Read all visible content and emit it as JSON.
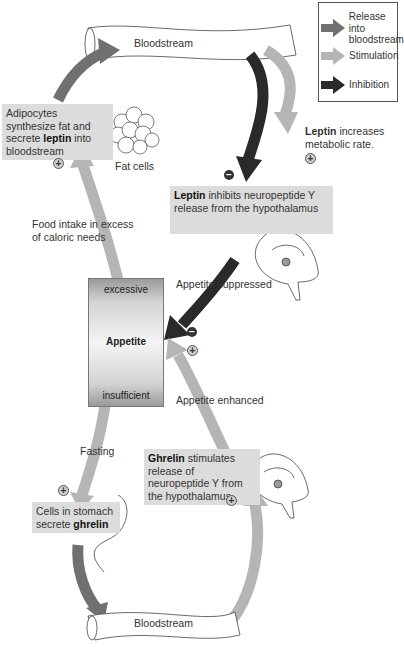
{
  "legend": {
    "items": [
      {
        "label": "Release into bloodstream",
        "line1": "Release into",
        "line2": "bloodstream",
        "color": "#707070"
      },
      {
        "label": "Stimulation",
        "color": "#b5b5b5"
      },
      {
        "label": "Inhibition",
        "color": "#2a2a2a"
      }
    ]
  },
  "vessels": {
    "top": "Bloodstream",
    "bottom": "Bloodstream"
  },
  "boxes": {
    "adipocytes": {
      "pre": "Adipocytes synthesize fat and secrete ",
      "bold": "leptin",
      "post": " into bloodstream"
    },
    "leptin_inhibits": {
      "bold": "Leptin",
      "post": " inhibits neuropeptide Y release from the hypothalamus"
    },
    "ghrelin_stimulates": {
      "bold": "Ghrelin",
      "post": " stimulates release of neuropeptide Y from the hypothalamus"
    },
    "stomach_cells": {
      "pre": "Cells in stomach secrete ",
      "bold": "ghrelin"
    }
  },
  "labels": {
    "fat_cells": "Fat cells",
    "leptin_metabolic_bold": "Leptin",
    "leptin_metabolic_rest": " increases metabolic rate.",
    "food_intake": "Food intake in excess of caloric needs",
    "appetite_suppressed": "Appetite suppressed",
    "appetite_enhanced": "Appetite enhanced",
    "fasting": "Fasting"
  },
  "appetite": {
    "top": "excessive",
    "center": "Appetite",
    "bottom": "insufficient"
  },
  "signs": {
    "plus": "+",
    "minus": "−"
  },
  "colors": {
    "release": "#707070",
    "stimulation": "#b5b5b5",
    "inhibition": "#2a2a2a",
    "box_bg": "#dcdcdc"
  }
}
